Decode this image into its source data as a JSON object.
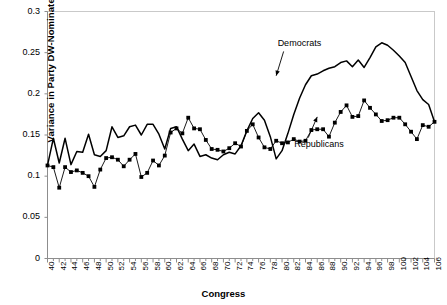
{
  "chart_data": {
    "type": "line",
    "title": "",
    "xlabel": "Congress",
    "ylabel": "Variance in Party DW-Nominate Score",
    "xlim": [
      40,
      106
    ],
    "ylim": [
      0,
      0.3
    ],
    "grid": false,
    "legend_position": "inline-annotations",
    "ytick_labels": [
      "0",
      "0.05",
      "0.1",
      "0.15",
      "0.2",
      "0.25",
      "0.3"
    ],
    "ytick_values": [
      0,
      0.05,
      0.1,
      0.15,
      0.2,
      0.25,
      0.3
    ],
    "xtick_labels": [
      "40",
      "42",
      "44",
      "46",
      "48",
      "50",
      "52",
      "54",
      "56",
      "58",
      "60",
      "62",
      "64",
      "66",
      "68",
      "70",
      "72",
      "74",
      "76",
      "78",
      "80",
      "82",
      "84",
      "86",
      "88",
      "90",
      "92",
      "94",
      "96",
      "98",
      "100",
      "102",
      "104",
      "106"
    ],
    "xtick_values": [
      40,
      42,
      44,
      46,
      48,
      50,
      52,
      54,
      56,
      58,
      60,
      62,
      64,
      66,
      68,
      70,
      72,
      74,
      76,
      78,
      80,
      82,
      84,
      86,
      88,
      90,
      92,
      94,
      96,
      98,
      100,
      102,
      104,
      106
    ],
    "x": [
      40,
      41,
      42,
      43,
      44,
      45,
      46,
      47,
      48,
      49,
      50,
      51,
      52,
      53,
      54,
      55,
      56,
      57,
      58,
      59,
      60,
      61,
      62,
      63,
      64,
      65,
      66,
      67,
      68,
      69,
      70,
      71,
      72,
      73,
      74,
      75,
      76,
      77,
      78,
      79,
      80,
      81,
      82,
      83,
      84,
      85,
      86,
      87,
      88,
      89,
      90,
      91,
      92,
      93,
      94,
      95,
      96,
      97,
      98,
      99,
      100,
      101,
      102,
      103,
      104,
      105,
      106
    ],
    "annotations": [
      {
        "text": "Democrats",
        "x": 83,
        "y": 0.243,
        "target_x": 79,
        "target_y": 0.222
      },
      {
        "text": "Republicans",
        "x": 86,
        "y": 0.148,
        "target_x": 86,
        "target_y": 0.172
      }
    ],
    "series": [
      {
        "name": "Democrats",
        "marker": "none",
        "color": "#000000",
        "values": [
          0.113,
          0.146,
          0.116,
          0.146,
          0.114,
          0.13,
          0.129,
          0.151,
          0.126,
          0.124,
          0.131,
          0.16,
          0.147,
          0.149,
          0.16,
          0.162,
          0.15,
          0.163,
          0.163,
          0.151,
          0.133,
          0.158,
          0.16,
          0.145,
          0.131,
          0.139,
          0.124,
          0.126,
          0.122,
          0.12,
          0.126,
          0.129,
          0.127,
          0.137,
          0.155,
          0.17,
          0.177,
          0.168,
          0.148,
          0.121,
          0.131,
          0.152,
          0.175,
          0.195,
          0.211,
          0.222,
          0.224,
          0.228,
          0.231,
          0.233,
          0.238,
          0.24,
          0.233,
          0.241,
          0.232,
          0.244,
          0.257,
          0.262,
          0.259,
          0.253,
          0.246,
          0.238,
          0.221,
          0.204,
          0.193,
          0.187,
          0.166
        ]
      },
      {
        "name": "Republicans",
        "marker": "square",
        "color": "#000000",
        "values": [
          0.113,
          0.111,
          0.086,
          0.111,
          0.105,
          0.107,
          0.104,
          0.1,
          0.087,
          0.108,
          0.122,
          0.123,
          0.12,
          0.112,
          0.12,
          0.127,
          0.099,
          0.104,
          0.119,
          0.113,
          0.125,
          0.153,
          0.158,
          0.152,
          0.171,
          0.158,
          0.157,
          0.144,
          0.133,
          0.132,
          0.13,
          0.134,
          0.14,
          0.136,
          0.155,
          0.163,
          0.147,
          0.135,
          0.133,
          0.143,
          0.14,
          0.141,
          0.145,
          0.142,
          0.143,
          0.156,
          0.157,
          0.157,
          0.148,
          0.165,
          0.178,
          0.186,
          0.172,
          0.173,
          0.192,
          0.183,
          0.175,
          0.167,
          0.168,
          0.171,
          0.171,
          0.163,
          0.154,
          0.145,
          0.162,
          0.16,
          0.166
        ]
      }
    ]
  }
}
